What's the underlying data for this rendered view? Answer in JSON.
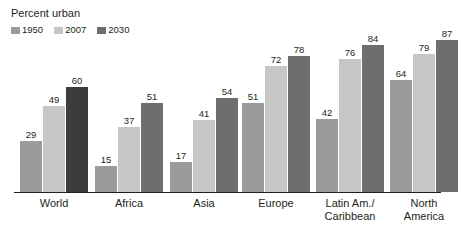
{
  "chart_data": {
    "type": "bar",
    "title": "Percent urban",
    "xlabel": "",
    "ylabel": "",
    "ylim": [
      0,
      90
    ],
    "grid": false,
    "legend_position": "top-left",
    "categories": [
      "World",
      "Africa",
      "Asia",
      "Europe",
      "Latin Am./\nCaribbean",
      "North\nAmerica"
    ],
    "series": [
      {
        "name": "1950",
        "color": "#9b9b9b",
        "values": [
          29,
          15,
          17,
          51,
          42,
          64
        ]
      },
      {
        "name": "2007",
        "color": "#c6c6c6",
        "values": [
          49,
          37,
          41,
          72,
          76,
          79
        ]
      },
      {
        "name": "2030",
        "color": "#6e6e6e",
        "values": [
          60,
          51,
          54,
          78,
          84,
          87
        ]
      }
    ],
    "highlight": {
      "category": "World",
      "series": "2030",
      "color": "#3c3c3c"
    },
    "axis_color": "#231f20",
    "background": "#ffffff"
  },
  "legend": {
    "items": [
      {
        "label": "1950",
        "swatch": "#9b9b9b"
      },
      {
        "label": "2007",
        "swatch": "#c6c6c6"
      },
      {
        "label": "2030",
        "swatch": "#6e6e6e"
      }
    ]
  }
}
